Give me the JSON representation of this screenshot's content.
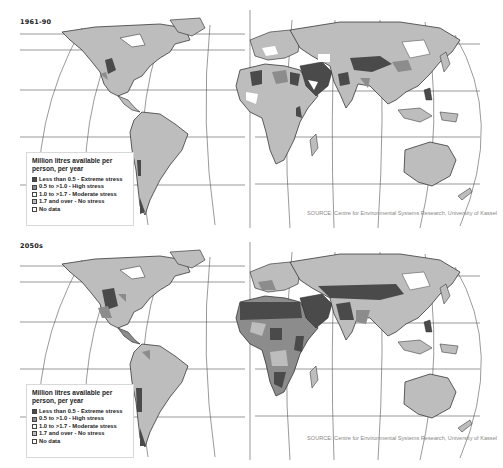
{
  "figure": {
    "colors": {
      "extreme": "#4a4a4a",
      "high": "#8c8c8c",
      "moderate": "#ffffff",
      "none": "#bdbdbd",
      "nodata": "#ffffff",
      "ocean": "#ffffff",
      "border": "#333333",
      "graticule": "#555555"
    }
  },
  "panels": [
    {
      "title": "1961-90",
      "legend": {
        "title_line1": "Million litres available per",
        "title_line2": "person, per year",
        "items": [
          {
            "label": "Less than 0.5 - Extreme stress",
            "swatch": "extreme"
          },
          {
            "label": "0.5 to >1.0 - High stress",
            "swatch": "high"
          },
          {
            "label": "1.0 to >1.7 - Moderate stress",
            "swatch": "moderate"
          },
          {
            "label": "1.7 and over - No stress",
            "swatch": "none"
          },
          {
            "label": "No data",
            "swatch": "nodata"
          }
        ]
      },
      "source": "SOURCE: Centre for Environmental Systems Research, University of Kassel"
    },
    {
      "title": "2050s",
      "legend": {
        "title_line1": "Million litres available per",
        "title_line2": "person, per year",
        "items": [
          {
            "label": "Less than 0.5 - Extreme stress",
            "swatch": "extreme"
          },
          {
            "label": "0.5 to >1.0 - High stress",
            "swatch": "high"
          },
          {
            "label": "1.0 to >1.7 - Moderate stress",
            "swatch": "moderate"
          },
          {
            "label": "1.7 and over - No stress",
            "swatch": "none"
          },
          {
            "label": "No data",
            "swatch": "nodata"
          }
        ]
      },
      "source": "SOURCE: Centre for Environmental Systems Research, University of Kassel"
    }
  ]
}
